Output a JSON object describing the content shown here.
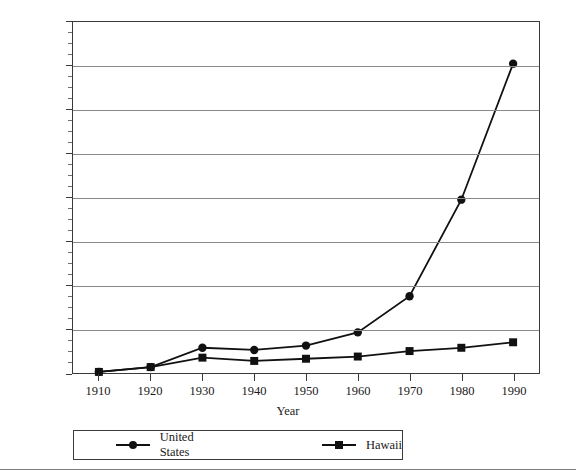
{
  "chart_data": {
    "type": "line",
    "title": "",
    "xlabel": "Year",
    "ylabel": "",
    "x": [
      1910,
      1920,
      1930,
      1940,
      1950,
      1960,
      1970,
      1980,
      1990
    ],
    "xtick_labels": [
      "1910",
      "1920",
      "1930",
      "1940",
      "1950",
      "1960",
      "1970",
      "1980",
      "1990"
    ],
    "ytick_labels": [
      "0",
      "200,000",
      "400,000",
      "600,000",
      "800,000",
      "1,000,000",
      "1,200,000",
      "1,400,000",
      "1,600,000"
    ],
    "ytick_values": [
      0,
      200000,
      400000,
      600000,
      800000,
      1000000,
      1200000,
      1400000,
      1600000
    ],
    "ylim": [
      0,
      1600000
    ],
    "xlim": [
      1905,
      1995
    ],
    "y_minor_tick_step": 50000,
    "grid": "horizontal",
    "legend_position": "below-axes",
    "series": [
      {
        "name": "United States",
        "marker": "circle",
        "color": "#111111",
        "values": [
          5000,
          27000,
          115000,
          105000,
          125000,
          185000,
          350000,
          790000,
          1410000
        ]
      },
      {
        "name": "Hawaii",
        "marker": "square",
        "color": "#111111",
        "values": [
          5000,
          27000,
          70000,
          55000,
          65000,
          75000,
          100000,
          115000,
          140000
        ]
      }
    ]
  },
  "legend": {
    "entries": [
      {
        "label": "United States",
        "marker": "circle"
      },
      {
        "label": "Hawaii",
        "marker": "square"
      }
    ]
  },
  "axis": {
    "x_title": "Year"
  },
  "colors": {
    "line": "#111111",
    "gridline": "#8a8a8a",
    "frame": "#3a3a3a",
    "text": "#1a1a1a",
    "background": "#ffffff"
  }
}
